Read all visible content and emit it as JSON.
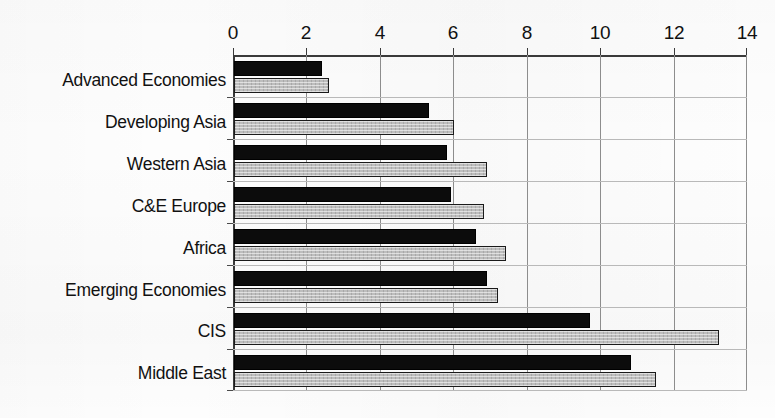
{
  "chart_data": {
    "type": "bar",
    "orientation": "horizontal",
    "title": "",
    "subtitle": "",
    "xlabel": "",
    "ylabel": "",
    "xlim": [
      0,
      14
    ],
    "xticks": [
      0,
      2,
      4,
      6,
      8,
      10,
      12,
      14
    ],
    "xtick_labels": [
      "0",
      "2",
      "4",
      "6",
      "8",
      "10",
      "12",
      "14"
    ],
    "grid": true,
    "grid_axis": "x",
    "legend_position": "middle-right-inside",
    "categories": [
      "Advanced Economies",
      "Developing Asia",
      "Western Asia",
      "C&E Europe",
      "Africa",
      "Emerging Economies",
      "CIS",
      "Middle East"
    ],
    "series": [
      {
        "name": "2007",
        "color": "#0c0c0c",
        "values": [
          2.4,
          5.3,
          5.8,
          5.9,
          6.6,
          6.9,
          9.7,
          10.8
        ]
      },
      {
        "name": "2008",
        "color": "#c0c0c0",
        "values": [
          2.6,
          6.0,
          6.9,
          6.8,
          7.4,
          7.2,
          13.2,
          11.5
        ]
      }
    ]
  },
  "legend": {
    "entries": [
      {
        "label": "2007",
        "swatch": "black-square-icon"
      },
      {
        "label": "2008",
        "swatch": "gray-square-icon"
      }
    ]
  }
}
